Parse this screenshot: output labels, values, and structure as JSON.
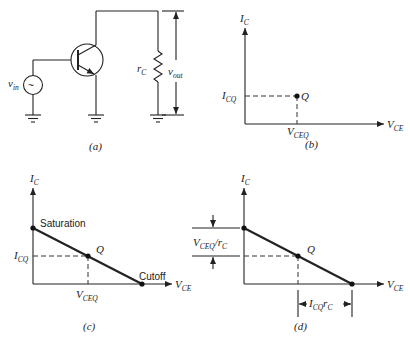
{
  "panels": {
    "a": {
      "caption": "(a)",
      "vin_label": "v",
      "vin_sub": "in",
      "source_symbol": "~",
      "rc_label": "r",
      "rc_sub": "C",
      "vout_label": "v",
      "vout_sub": "out"
    },
    "b": {
      "caption": "(b)",
      "y_axis": "I",
      "y_axis_sub": "C",
      "x_axis": "V",
      "x_axis_sub": "CE",
      "icq": "I",
      "icq_sub": "CQ",
      "vceq": "V",
      "vceq_sub": "CEQ",
      "point": "Q"
    },
    "c": {
      "caption": "(c)",
      "y_axis": "I",
      "y_axis_sub": "C",
      "x_axis": "V",
      "x_axis_sub": "CE",
      "icq": "I",
      "icq_sub": "CQ",
      "vceq": "V",
      "vceq_sub": "CEQ",
      "point": "Q",
      "saturation": "Saturation",
      "cutoff": "Cutoff"
    },
    "d": {
      "caption": "(d)",
      "y_axis": "I",
      "y_axis_sub": "C",
      "x_axis": "V",
      "x_axis_sub": "CE",
      "point": "Q",
      "vert_dim": "V",
      "vert_dim_sub": "CEQ",
      "vert_dim_tail": "/r",
      "vert_dim_tail_sub": "C",
      "horiz_dim": "I",
      "horiz_dim_sub": "CQ",
      "horiz_dim_tail": "r",
      "horiz_dim_tail_sub": "C"
    }
  }
}
